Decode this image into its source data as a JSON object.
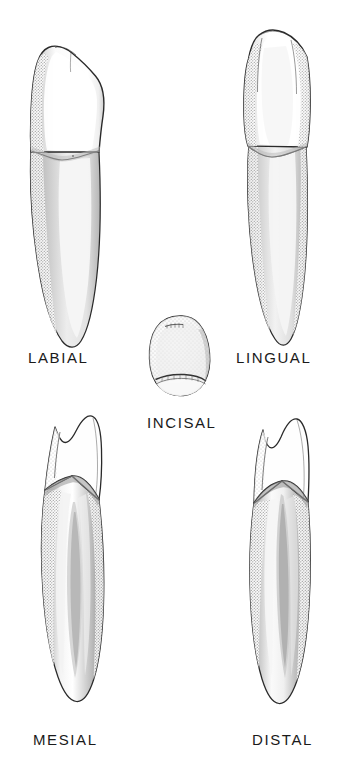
{
  "figure": {
    "background_color": "#ffffff",
    "ink_color": "#1a1a1a",
    "enamel_fill": "#fdfdfd",
    "root_fill": "#efefef",
    "shade_light": "#e2e2e2",
    "shade_mid": "#c9c9c9",
    "shade_dark": "#ababab",
    "views": [
      {
        "id": "labial",
        "label": "LABIAL",
        "label_x": 28,
        "label_y": 363,
        "position": "top-left"
      },
      {
        "id": "lingual",
        "label": "LINGUAL",
        "label_x": 236,
        "label_y": 363,
        "position": "top-right"
      },
      {
        "id": "incisal",
        "label": "INCISAL",
        "label_x": 147,
        "label_y": 428,
        "position": "center"
      },
      {
        "id": "mesial",
        "label": "MESIAL",
        "label_x": 33,
        "label_y": 745,
        "position": "bottom-left"
      },
      {
        "id": "distal",
        "label": "DISTAL",
        "label_x": 252,
        "label_y": 745,
        "position": "bottom-right"
      }
    ]
  }
}
